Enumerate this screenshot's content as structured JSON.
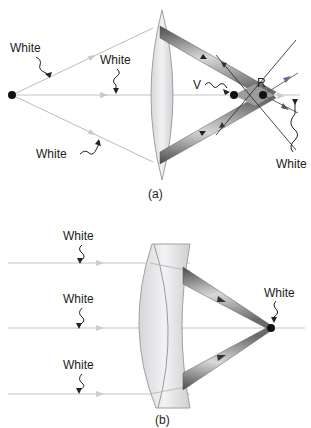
{
  "figure": {
    "panels": [
      {
        "id": "a",
        "caption": "(a)",
        "lens_type": "biconvex",
        "labels": {
          "ray_top": "White",
          "ray_axis": "White",
          "ray_bottom": "White",
          "virtual_point": "V",
          "real_point": "R",
          "outgoing": "White"
        }
      },
      {
        "id": "b",
        "caption": "(b)",
        "lens_type": "meniscus",
        "labels": {
          "ray_top": "White",
          "ray_mid": "White",
          "ray_bottom": "White",
          "focus": "White"
        }
      }
    ],
    "colors": {
      "ray": "#b8b8b8",
      "lens_fill": "#e4e4e8",
      "lens_stroke": "#9a9a9a",
      "cone_dark": "#555555",
      "cone_light": "#d0d0d0",
      "point": "#111111",
      "text": "#222222"
    }
  }
}
